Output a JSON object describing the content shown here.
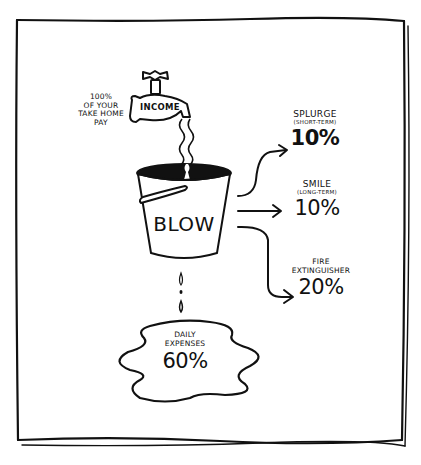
{
  "diagram": {
    "source": {
      "tap_label": "INCOME",
      "note_lines": [
        "100%",
        "OF YOUR",
        "TAKE HOME",
        "PAY"
      ]
    },
    "bucket": {
      "label": "BLOW"
    },
    "leak": {
      "title_lines": [
        "DAILY",
        "EXPENSES"
      ],
      "value": "60%"
    },
    "outputs": [
      {
        "title": "SPLURGE",
        "subtitle": "(SHORT-TERM)",
        "value": "10%"
      },
      {
        "title": "SMILE",
        "subtitle": "(LONG-TERM)",
        "value": "10%"
      },
      {
        "title": "FIRE",
        "subtitle": "EXTINGUISHER",
        "value": "20%"
      }
    ]
  },
  "colors": {
    "ink": "#111111",
    "paper": "#ffffff"
  }
}
